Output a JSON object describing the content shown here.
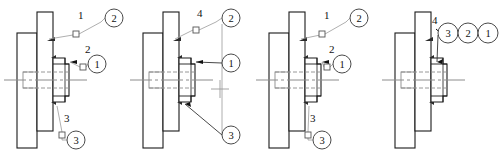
{
  "figure": {
    "type": "engineering-drawing",
    "panel_count": 4,
    "canvas": {
      "width": 504,
      "height": 160
    },
    "colors": {
      "outline": "#1a1a1a",
      "leader": "#9a9a9a",
      "balloon_stroke": "#4a4a4a",
      "centerline": "#8c8c8c",
      "hatch": "#2b2b2b",
      "background": "#ffffff"
    }
  },
  "panels": [
    {
      "id": "panel-1",
      "name": "view-a",
      "x": 0,
      "labels": [
        {
          "name": "label-1-top",
          "text": "1",
          "x": 78,
          "y": 19,
          "marker": "square",
          "marker_x": 73,
          "marker_y": 31
        },
        {
          "name": "label-2-mid",
          "text": "2",
          "x": 85,
          "y": 53,
          "marker": "square",
          "marker_x": 80,
          "marker_y": 64
        },
        {
          "name": "label-3-bottom",
          "text": "3",
          "x": 64,
          "y": 122,
          "marker": "square",
          "marker_x": 59,
          "marker_y": 132
        }
      ],
      "balloons": [
        {
          "name": "balloon-2",
          "text": "2",
          "cx": 114,
          "cy": 18,
          "r": 9
        },
        {
          "name": "balloon-1",
          "text": "1",
          "cx": 97,
          "cy": 64,
          "r": 9
        },
        {
          "name": "balloon-3",
          "text": "3",
          "cx": 76,
          "cy": 140,
          "r": 9
        }
      ]
    },
    {
      "id": "panel-2",
      "name": "view-b",
      "x": 126,
      "labels": [
        {
          "name": "label-4-top",
          "text": "4",
          "x": 71,
          "y": 17,
          "marker": "square",
          "marker_x": 67,
          "marker_y": 27
        }
      ],
      "balloons": [
        {
          "name": "balloon-2",
          "text": "2",
          "cx": 105,
          "cy": 18,
          "r": 9
        },
        {
          "name": "balloon-1",
          "text": "1",
          "cx": 105,
          "cy": 63,
          "r": 9
        },
        {
          "name": "balloon-3",
          "text": "3",
          "cx": 105,
          "cy": 135,
          "r": 9
        }
      ],
      "crosshair": {
        "name": "crosshair-marker",
        "x": 94,
        "y": 89,
        "size": 9
      }
    },
    {
      "id": "panel-3",
      "name": "view-c",
      "x": 252,
      "labels": [
        {
          "name": "label-1-top",
          "text": "1",
          "x": 72,
          "y": 19,
          "marker": "square",
          "marker_x": 67,
          "marker_y": 31
        },
        {
          "name": "label-2-mid",
          "text": "2",
          "x": 77,
          "y": 53,
          "marker": "square",
          "marker_x": 72,
          "marker_y": 64
        },
        {
          "name": "label-3-bottom",
          "text": "3",
          "x": 58,
          "y": 122,
          "marker": "square",
          "marker_x": 53,
          "marker_y": 132
        }
      ],
      "balloons": [
        {
          "name": "balloon-2",
          "text": "2",
          "cx": 107,
          "cy": 18,
          "r": 9
        },
        {
          "name": "balloon-1",
          "text": "1",
          "cx": 90,
          "cy": 64,
          "r": 9
        },
        {
          "name": "balloon-3",
          "text": "3",
          "cx": 70,
          "cy": 140,
          "r": 9
        }
      ]
    },
    {
      "id": "panel-4",
      "name": "view-d",
      "x": 378,
      "labels": [
        {
          "name": "label-4-top",
          "text": "4",
          "x": 54,
          "y": 24,
          "marker": "arrow",
          "marker_x": 60,
          "marker_y": 32
        }
      ],
      "balloons": [
        {
          "name": "balloon-3",
          "text": "3",
          "cx": 70,
          "cy": 33,
          "r": 10
        },
        {
          "name": "balloon-2",
          "text": "2",
          "cx": 90,
          "cy": 33,
          "r": 10
        },
        {
          "name": "balloon-1",
          "text": "1",
          "cx": 110,
          "cy": 33,
          "r": 10
        }
      ]
    }
  ],
  "geometry": {
    "note": "shared cross-section outline per panel (local coords within 126x160 panel)",
    "tall_plate": {
      "x": 37,
      "y": 12,
      "w": 16,
      "h": 119
    },
    "wide_plate": {
      "x": 17,
      "y": 33,
      "w": 20,
      "h": 115
    },
    "hub_cx": 53,
    "axis_y": 80
  }
}
